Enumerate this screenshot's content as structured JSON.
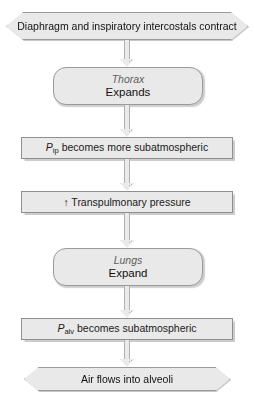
{
  "diagram": {
    "background_color": "#ffffff",
    "node_fill": "#e9e9e9",
    "node_border": "#9a9a9a",
    "text_color": "#111111",
    "organ_text_color": "#5e5e5e",
    "nodes": [
      {
        "id": "n1",
        "shape": "hexagon",
        "text": "Diaphragm and inspiratory intercostals contract"
      },
      {
        "id": "n2",
        "shape": "rounded-rectangle",
        "organ": "Thorax",
        "action": "Expands"
      },
      {
        "id": "n3",
        "shape": "rectangle",
        "symbol": "P",
        "subscript": "ip",
        "text": " becomes more subatmospheric"
      },
      {
        "id": "n4",
        "shape": "rectangle",
        "arrow": "↑",
        "text": " Transpulmonary pressure"
      },
      {
        "id": "n5",
        "shape": "rounded-rectangle",
        "organ": "Lungs",
        "action": "Expand"
      },
      {
        "id": "n6",
        "shape": "rectangle",
        "symbol": "P",
        "subscript": "alv",
        "text": " becomes subatmospheric"
      },
      {
        "id": "n7",
        "shape": "hexagon",
        "text": "Air flows into alveoli"
      }
    ],
    "connectors": [
      {
        "id": "c1",
        "from": "n1",
        "to": "n2",
        "type": "down-arrow"
      },
      {
        "id": "c2",
        "from": "n2",
        "to": "n3",
        "type": "down-arrow"
      },
      {
        "id": "c3",
        "from": "n3",
        "to": "n4",
        "type": "down-arrow"
      },
      {
        "id": "c4",
        "from": "n4",
        "to": "n5",
        "type": "down-arrow"
      },
      {
        "id": "c5",
        "from": "n5",
        "to": "n6",
        "type": "down-arrow"
      },
      {
        "id": "c6",
        "from": "n6",
        "to": "n7",
        "type": "down-arrow"
      }
    ]
  }
}
